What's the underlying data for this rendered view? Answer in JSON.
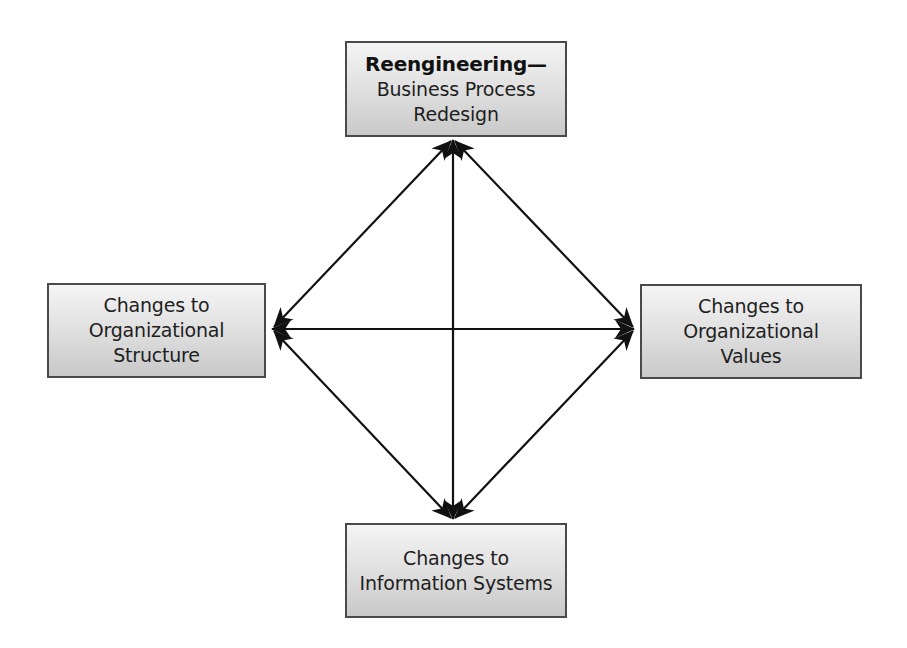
{
  "diagram": {
    "nodes": {
      "top": {
        "heading": "Reengineering—",
        "lines": [
          "Business Process",
          "Redesign"
        ]
      },
      "left": {
        "lines": [
          "Changes to",
          "Organizational",
          "Structure"
        ]
      },
      "right": {
        "lines": [
          "Changes to",
          "Organizational",
          "Values"
        ]
      },
      "bottom": {
        "lines": [
          "Changes to",
          "Information Systems"
        ]
      }
    },
    "edges": [
      {
        "from": "top",
        "to": "left",
        "type": "bidirectional"
      },
      {
        "from": "top",
        "to": "right",
        "type": "bidirectional"
      },
      {
        "from": "top",
        "to": "bottom",
        "type": "bidirectional"
      },
      {
        "from": "left",
        "to": "right",
        "type": "bidirectional"
      },
      {
        "from": "left",
        "to": "bottom",
        "type": "bidirectional"
      },
      {
        "from": "right",
        "to": "bottom",
        "type": "bidirectional"
      }
    ],
    "colors": {
      "line": "#111111",
      "box_border": "#4a4a4a",
      "box_fill_top": "#f4f4f4",
      "box_fill_bottom": "#c9c9c9",
      "text": "#1e1e1e"
    }
  }
}
